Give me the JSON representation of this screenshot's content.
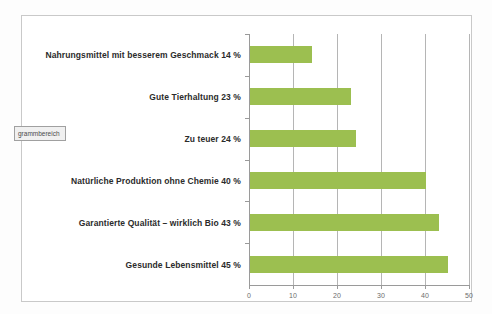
{
  "chart_data": {
    "type": "bar",
    "orientation": "horizontal",
    "title": "",
    "xlabel": "",
    "ylabel": "",
    "xlim": [
      0,
      50
    ],
    "xticks": [
      "0",
      "10",
      "20",
      "30",
      "40",
      "50"
    ],
    "grid": true,
    "legend": "none",
    "bar_color": "#9cbf50",
    "categories": [
      "Nahrungsmittel mit besserem Geschmack 14 %",
      "Gute Tierhaltung 23 %",
      "Zu teuer 24 %",
      "Natürliche Produktion ohne Chemie 40 %",
      "Garantierte Qualität – wirklich Bio 43 %",
      "Gesunde Lebensmittel 45 %"
    ],
    "values": [
      14,
      23,
      24,
      40,
      43,
      45
    ]
  },
  "overlay": {
    "chart_area_tooltip": "grammbereich"
  }
}
